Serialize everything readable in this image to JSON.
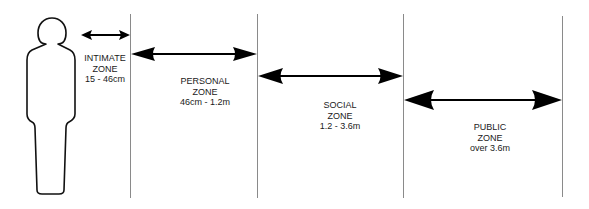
{
  "diagram": {
    "colors": {
      "line": "#888888",
      "arrow": "#000000",
      "figure": "#111111",
      "text": "#1a1a1a"
    },
    "figure": {
      "icon": "person-silhouette-icon"
    },
    "zones": [
      {
        "id": "intimate",
        "name": "INTIMATE",
        "word": "ZONE",
        "range": "15 - 46cm"
      },
      {
        "id": "personal",
        "name": "PERSONAL",
        "word": "ZONE",
        "range": "46cm - 1.2m"
      },
      {
        "id": "social",
        "name": "SOCIAL",
        "word": "ZONE",
        "range": "1.2 - 3.6m"
      },
      {
        "id": "public",
        "name": "PUBLIC",
        "word": "ZONE",
        "range": "over 3.6m"
      }
    ]
  }
}
